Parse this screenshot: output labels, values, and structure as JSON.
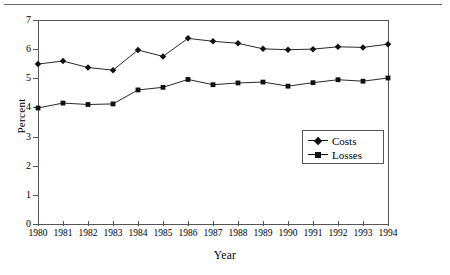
{
  "chart_data": {
    "type": "line",
    "title": "",
    "xlabel": "Year",
    "ylabel": "Percent",
    "categories": [
      "1980",
      "1981",
      "1982",
      "1983",
      "1984",
      "1985",
      "1986",
      "1987",
      "1988",
      "1989",
      "1990",
      "1991",
      "1992",
      "1993",
      "1994"
    ],
    "x": [
      1980,
      1981,
      1982,
      1983,
      1984,
      1985,
      1986,
      1987,
      1988,
      1989,
      1990,
      1991,
      1992,
      1993,
      1994
    ],
    "xlim": [
      1980,
      1994
    ],
    "ylim": [
      0,
      7
    ],
    "yticks": [
      0,
      1,
      2,
      3,
      4,
      5,
      6,
      7
    ],
    "grid": false,
    "legend_position": "lower-right",
    "series": [
      {
        "name": "Costs",
        "marker": "diamond",
        "values": [
          5.49,
          5.59,
          5.37,
          5.28,
          5.97,
          5.75,
          6.37,
          6.27,
          6.2,
          6.01,
          5.98,
          6.0,
          6.08,
          6.06,
          6.17
        ]
      },
      {
        "name": "Losses",
        "marker": "square",
        "values": [
          3.98,
          4.15,
          4.1,
          4.12,
          4.6,
          4.69,
          4.96,
          4.78,
          4.84,
          4.87,
          4.73,
          4.85,
          4.95,
          4.9,
          5.01
        ]
      }
    ]
  },
  "colors": {
    "line": "#111111",
    "axis": "#555555",
    "rule": "#6a6a6a",
    "background": "#ffffff"
  }
}
